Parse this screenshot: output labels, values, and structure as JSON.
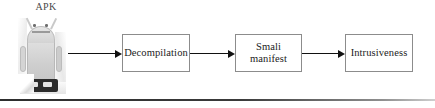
{
  "figure": {
    "type": "flowchart",
    "background_color": "#ffffff",
    "source": {
      "label": "APK",
      "icon": "android-robot-icon"
    },
    "nodes": [
      {
        "id": "decompilation",
        "label": "Decompilation",
        "lines": [
          "Decompilation"
        ]
      },
      {
        "id": "smali-manifest",
        "label": "Smali manifest",
        "lines": [
          "Smali",
          "manifest"
        ]
      },
      {
        "id": "intrusiveness",
        "label": "Intrusiveness",
        "lines": [
          "Intrusiveness"
        ]
      }
    ],
    "edges": [
      {
        "id": "edge-apk-decompilation",
        "from": "APK",
        "to": "Decompilation",
        "style": "solid-arrow"
      },
      {
        "id": "edge-decompilation-smali",
        "from": "Decompilation",
        "to": "Smali manifest",
        "style": "solid-arrow"
      },
      {
        "id": "edge-smali-intrusiveness",
        "from": "Smali manifest",
        "to": "Intrusiveness",
        "style": "solid-arrow"
      }
    ],
    "colors": {
      "box_border": "#8c8c8c",
      "arrow": "#111111",
      "text": "#222222",
      "label_text": "#4a4a4a",
      "rule": "#2d2d2d"
    },
    "rule": {
      "present": true,
      "position": "bottom"
    }
  }
}
